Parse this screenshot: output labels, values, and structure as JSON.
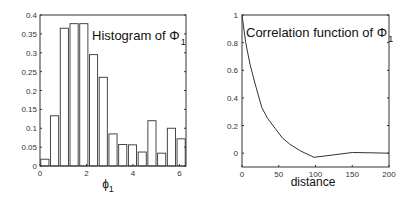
{
  "chart_data": [
    {
      "type": "bar",
      "title": "Histogram of Φ",
      "title_subscript": "1",
      "xlabel": "ϕ",
      "xlabel_subscript": "1",
      "ylabel": "",
      "xlim": [
        0,
        6.283
      ],
      "ylim": [
        0,
        0.4
      ],
      "xticks": [
        "0",
        "2",
        "4",
        "6"
      ],
      "yticks": [
        "0",
        "0.05",
        "0.1",
        "0.15",
        "0.2",
        "0.25",
        "0.3",
        "0.35",
        "0.4"
      ],
      "bin_width": 0.419,
      "bin_starts": [
        0,
        0.419,
        0.838,
        1.257,
        1.676,
        2.094,
        2.513,
        2.932,
        3.351,
        3.77,
        4.189,
        4.608,
        5.027,
        5.445,
        5.864
      ],
      "values": [
        0.018,
        0.133,
        0.365,
        0.377,
        0.377,
        0.295,
        0.235,
        0.085,
        0.057,
        0.056,
        0.037,
        0.12,
        0.034,
        0.1,
        0.072
      ],
      "grid": false
    },
    {
      "type": "line",
      "title": "Correlation function of Φ",
      "title_subscript": "1",
      "xlabel": "distance",
      "ylabel": "",
      "xlim": [
        0,
        200
      ],
      "ylim": [
        -0.1,
        1
      ],
      "xticks": [
        "0",
        "50",
        "100",
        "150",
        "200"
      ],
      "yticks": [
        "0",
        "0.2",
        "0.4",
        "0.6",
        "0.8",
        "1"
      ],
      "x": [
        0,
        5,
        11,
        18,
        27,
        35,
        45,
        55,
        65,
        80,
        98,
        120,
        150,
        175,
        200
      ],
      "values": [
        1.0,
        0.8,
        0.64,
        0.5,
        0.33,
        0.25,
        0.18,
        0.11,
        0.065,
        0.015,
        -0.03,
        -0.015,
        0.005,
        0.003,
        0.0
      ],
      "grid": false
    }
  ]
}
